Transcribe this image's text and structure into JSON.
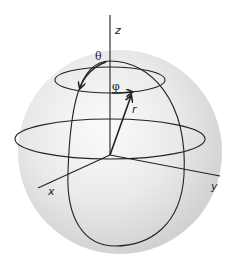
{
  "diagram": {
    "labels": {
      "z_axis": "z",
      "x_axis": "x",
      "y_axis": "y",
      "theta": "θ",
      "phi": "φ",
      "radius": "r"
    },
    "colors": {
      "line": "#222222",
      "sphere_light": "#f4f4f4",
      "sphere_mid": "#e2e2e2",
      "sphere_dark": "#c8c8c8",
      "background": "#ffffff"
    }
  }
}
